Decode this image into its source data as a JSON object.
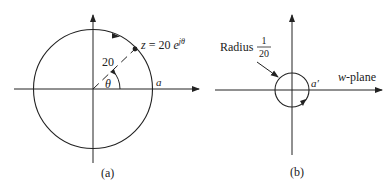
{
  "figure": {
    "panel_a": {
      "caption": "(a)",
      "point_label_lhs": "z",
      "point_label_eq": " = 20 ",
      "point_label_base": "e",
      "point_label_exp": "jθ",
      "radius_label": "20",
      "angle_label": "θ",
      "intercept_label": "a"
    },
    "panel_b": {
      "caption": "(b)",
      "radius_label_word": "Radius",
      "radius_num": "1",
      "radius_den": "20",
      "plane_label_var": "w",
      "plane_label_rest": "-plane",
      "intercept_label": "a′"
    },
    "colors": {
      "stroke": "#222222",
      "background": "#ffffff"
    }
  }
}
